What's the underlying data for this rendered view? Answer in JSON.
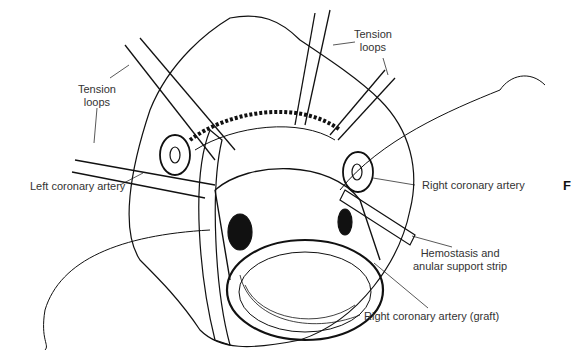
{
  "figure": {
    "panel_letter": "F",
    "labels": {
      "tension_loops_left": [
        "Tension",
        "loops"
      ],
      "tension_loops_top": [
        "Tension",
        "loops"
      ],
      "left_coronary_artery": "Left coronary artery",
      "right_coronary_artery": "Right coronary artery",
      "hemostasis_strip": [
        "Hemostasis and",
        "anular support strip"
      ],
      "right_coronary_artery_graft": "Right coronary artery (graft)"
    },
    "colors": {
      "ink": "#111111",
      "label": "#333333",
      "background": "#ffffff"
    }
  }
}
